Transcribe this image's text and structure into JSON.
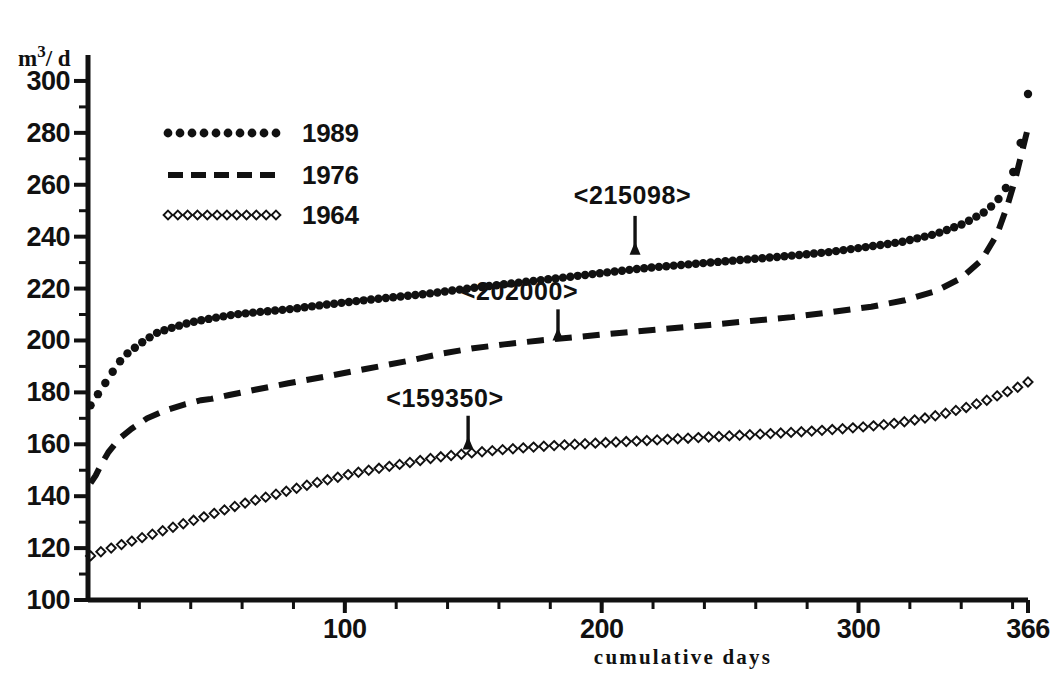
{
  "chart_data": {
    "type": "line",
    "title": "",
    "subtitle": "",
    "xlabel": "cumulative  days",
    "ylabel": "m3/d",
    "ylabel_base": "m",
    "ylabel_sup": "3",
    "ylabel_tail": "/ d",
    "xlim": [
      0,
      366
    ],
    "ylim": [
      100,
      310
    ],
    "grid": false,
    "legend_position": "upper-left-inside",
    "x_ticks_major": [
      100,
      200,
      300,
      366
    ],
    "x_tick_labels": [
      "100",
      "200",
      "300",
      "366"
    ],
    "x_ticks_minor_step": 20,
    "y_ticks_major": [
      100,
      120,
      140,
      160,
      180,
      200,
      220,
      240,
      260,
      280,
      300
    ],
    "y_tick_labels": [
      "100",
      "120",
      "140",
      "160",
      "180",
      "200",
      "220",
      "240",
      "260",
      "280",
      "300"
    ],
    "y_ticks_minor_step": 10,
    "series": [
      {
        "name": "1989",
        "style": "dotted",
        "marker": "filled-circle",
        "annotation_value": "<215098>",
        "x": [
          1,
          3,
          5,
          7,
          9,
          11,
          14,
          18,
          22,
          27,
          33,
          40,
          48,
          57,
          67,
          78,
          90,
          103,
          117,
          132,
          148,
          165,
          183,
          200,
          218,
          236,
          254,
          272,
          288,
          303,
          317,
          330,
          341,
          350,
          356,
          360,
          363,
          364,
          365,
          366
        ],
        "y": [
          175,
          178,
          181,
          184,
          187,
          190,
          194,
          197,
          200,
          203,
          205,
          207,
          208.5,
          210,
          211,
          212,
          213.5,
          215,
          216.5,
          218,
          220,
          222,
          224,
          226,
          228,
          229.5,
          231,
          232.5,
          234,
          236,
          238,
          241,
          245,
          250,
          256,
          264,
          275,
          284,
          290,
          295
        ]
      },
      {
        "name": "1976",
        "style": "dashed",
        "marker": "none",
        "annotation_value": "<202000>",
        "x": [
          1,
          3,
          5,
          8,
          12,
          17,
          23,
          30,
          38,
          44,
          48,
          55,
          65,
          78,
          92,
          108,
          124,
          138,
          150,
          162,
          176,
          192,
          208,
          225,
          242,
          258,
          274,
          290,
          305,
          318,
          330,
          340,
          348,
          354,
          358,
          361,
          363,
          365,
          366
        ],
        "y": [
          145,
          148,
          152,
          157,
          162,
          166,
          170,
          173,
          175.5,
          177,
          177.5,
          179,
          181,
          183.5,
          186,
          189,
          192,
          195,
          197,
          198.5,
          200,
          201.5,
          203,
          204.5,
          206,
          207.5,
          209,
          211,
          213,
          215.5,
          219,
          224,
          231,
          241,
          252,
          262,
          270,
          278,
          282
        ]
      },
      {
        "name": "1964",
        "style": "diamond-dotted",
        "marker": "open-diamond",
        "annotation_value": "<159350>",
        "x": [
          1,
          6,
          12,
          18,
          24,
          30,
          36,
          42,
          48,
          54,
          60,
          67,
          74,
          81,
          88,
          96,
          104,
          112,
          120,
          128,
          136,
          144,
          152,
          160,
          168,
          177,
          186,
          195,
          204,
          213,
          222,
          231,
          240,
          249,
          258,
          267,
          276,
          285,
          294,
          303,
          312,
          320,
          328,
          336,
          343,
          350,
          356,
          361,
          364,
          366
        ],
        "y": [
          117,
          119,
          121,
          123,
          125,
          127,
          129,
          131,
          133,
          135,
          137,
          139,
          141,
          143,
          145,
          147,
          149,
          150.5,
          152,
          153.5,
          155,
          156,
          157,
          157.8,
          158.5,
          159.2,
          159.8,
          160.3,
          160.8,
          161.2,
          161.7,
          162.2,
          162.7,
          163.2,
          163.7,
          164.2,
          164.7,
          165.3,
          166,
          166.8,
          167.8,
          169,
          170.5,
          172.5,
          174.5,
          177,
          179.5,
          181.5,
          183,
          184
        ]
      }
    ],
    "annotations": [
      {
        "label": "<215098>",
        "series": "1989",
        "label_x": 212,
        "label_y": 256,
        "arrow_x": 213,
        "arrow_from_y": 248,
        "arrow_to_y": 238
      },
      {
        "label": "<202000>",
        "series": "1976",
        "label_x": 168,
        "label_y": 219,
        "arrow_x": 183,
        "arrow_from_y": 212,
        "arrow_to_y": 205
      },
      {
        "label": "<159350>",
        "series": "1964",
        "label_x": 139,
        "label_y": 178,
        "arrow_x": 148,
        "arrow_from_y": 171,
        "arrow_to_y": 163
      }
    ],
    "legend": [
      {
        "label": "1989",
        "style": "dotted"
      },
      {
        "label": "1976",
        "style": "dashed"
      },
      {
        "label": "1964",
        "style": "diamond-dotted"
      }
    ],
    "colors": {
      "ink": "#111111",
      "background": "#ffffff"
    }
  }
}
